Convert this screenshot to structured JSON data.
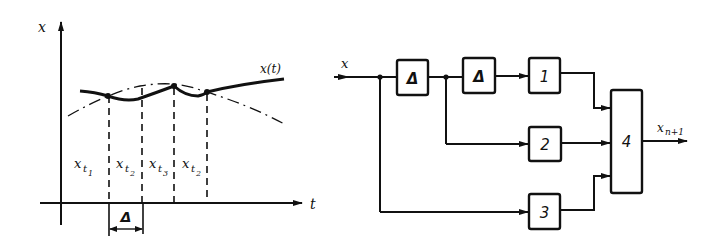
{
  "left_plot": {
    "y_axis_label": "x",
    "x_axis_label": "t",
    "curve_label": "x(t)",
    "interval_labels": [
      {
        "base": "x",
        "sub": "t",
        "subsub": "1"
      },
      {
        "base": "x",
        "sub": "t",
        "subsub": "2"
      },
      {
        "base": "x",
        "sub": "t",
        "subsub": "3"
      },
      {
        "base": "x",
        "sub": "t",
        "subsub": "2"
      }
    ],
    "delta_label": "Δ"
  },
  "block_diagram": {
    "input_label": "x",
    "output_label": "x",
    "output_sub": "n+1",
    "blocks": [
      {
        "id": "delay1",
        "label": "Δ"
      },
      {
        "id": "delay2",
        "label": "Δ"
      },
      {
        "id": "block1",
        "label": "1"
      },
      {
        "id": "block2",
        "label": "2"
      },
      {
        "id": "block3",
        "label": "3"
      },
      {
        "id": "block4",
        "label": "4"
      }
    ]
  },
  "colors": {
    "ink": "#111111",
    "background": "#ffffff"
  }
}
